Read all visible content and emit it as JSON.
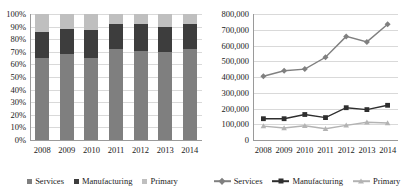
{
  "chart_data": [
    {
      "type": "bar",
      "id": "employment-share-stacked",
      "stacked": true,
      "stack_mode": "100%",
      "title": "",
      "xlabel": "",
      "ylabel": "",
      "categories": [
        "2008",
        "2009",
        "2010",
        "2011",
        "2012",
        "2013",
        "2014"
      ],
      "ytick_labels": [
        "0%",
        "10%",
        "20%",
        "30%",
        "40%",
        "50%",
        "60%",
        "70%",
        "80%",
        "90%",
        "100%"
      ],
      "ytick_values": [
        0,
        10,
        20,
        30,
        40,
        50,
        60,
        70,
        80,
        90,
        100
      ],
      "ylim": [
        0,
        100
      ],
      "grid": true,
      "legend_position": "bottom",
      "series": [
        {
          "name": "Services",
          "color": "#7f7f7f",
          "values": [
            65,
            68,
            65,
            72,
            71,
            70,
            72
          ]
        },
        {
          "name": "Manufacturing",
          "color": "#3d3d3d",
          "values": [
            21,
            20,
            22,
            20,
            21,
            20,
            20
          ]
        },
        {
          "name": "Primary",
          "color": "#bfbfbf",
          "values": [
            14,
            12,
            13,
            8,
            8,
            10,
            8
          ]
        }
      ]
    },
    {
      "type": "line",
      "id": "employment-levels-line",
      "title": "",
      "xlabel": "",
      "ylabel": "",
      "categories": [
        "2008",
        "2009",
        "2010",
        "2011",
        "2012",
        "2013",
        "2014"
      ],
      "ytick_labels": [
        "0",
        "100,000",
        "200,000",
        "300,000",
        "400,000",
        "500,000",
        "600,000",
        "700,000",
        "800,000"
      ],
      "ytick_values": [
        0,
        100000,
        200000,
        300000,
        400000,
        500000,
        600000,
        700000,
        800000
      ],
      "ylim": [
        0,
        800000
      ],
      "grid": true,
      "legend_position": "bottom",
      "series": [
        {
          "name": "Services",
          "color": "#808080",
          "marker": "diamond",
          "values": [
            405000,
            440000,
            450000,
            525000,
            658000,
            623000,
            735000
          ]
        },
        {
          "name": "Manufacturing",
          "color": "#2e2e2e",
          "marker": "square",
          "values": [
            135000,
            135000,
            162000,
            142000,
            205000,
            193000,
            220000
          ]
        },
        {
          "name": "Primary",
          "color": "#b3b3b3",
          "marker": "triangle",
          "values": [
            88000,
            76000,
            90000,
            72000,
            93000,
            113000,
            108000
          ]
        }
      ]
    }
  ],
  "bar_chart": {
    "legend": [
      {
        "label": "Services",
        "key": "services"
      },
      {
        "label": "Manufacturing",
        "key": "manufacturing"
      },
      {
        "label": "Primary",
        "key": "primary"
      }
    ]
  },
  "line_chart": {
    "legend": [
      {
        "label": "Services",
        "key": "services"
      },
      {
        "label": "Manufacturing",
        "key": "manufacturing"
      },
      {
        "label": "Primary",
        "key": "primary"
      }
    ]
  }
}
